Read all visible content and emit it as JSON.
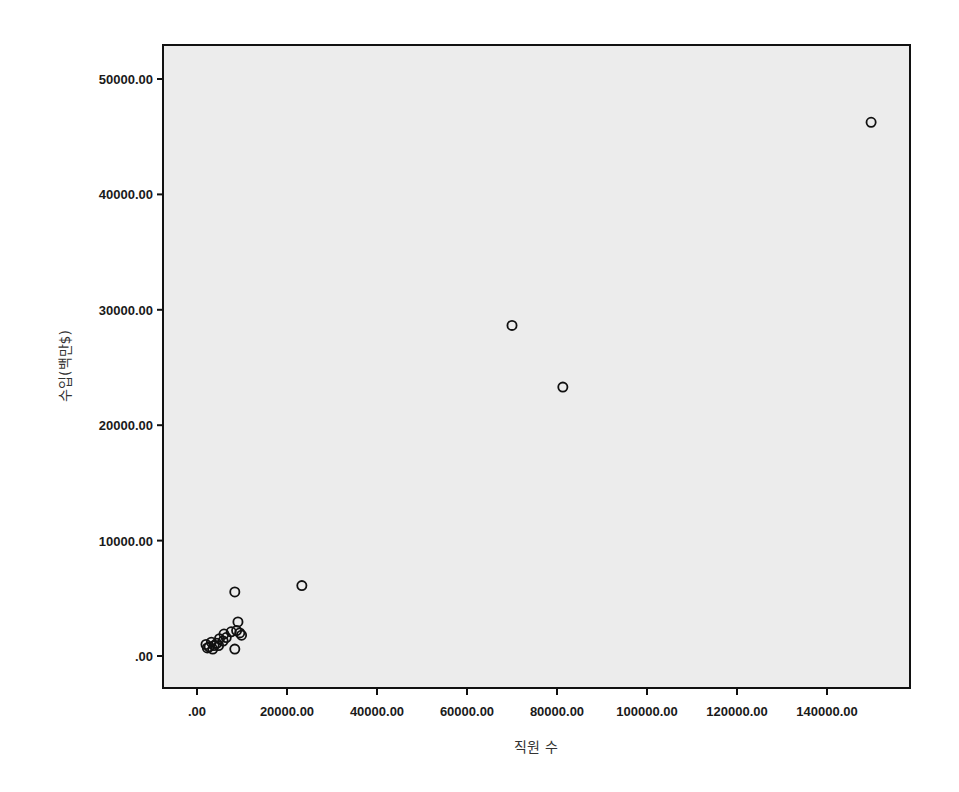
{
  "chart_data": {
    "type": "scatter",
    "title": "",
    "xlabel": "직원 수",
    "ylabel": "수입(백만$)",
    "xlim": [
      -8000,
      157000
    ],
    "ylim": [
      -2700,
      52500
    ],
    "x_ticks": [
      0,
      20000,
      40000,
      60000,
      80000,
      100000,
      120000,
      140000
    ],
    "x_tick_labels": [
      ".00",
      "20000.00",
      "40000.00",
      "60000.00",
      "80000.00",
      "100000.00",
      "120000.00",
      "140000.00"
    ],
    "y_ticks": [
      0,
      10000,
      20000,
      30000,
      40000,
      50000
    ],
    "y_tick_labels": [
      ".00",
      "10000.00",
      "20000.00",
      "30000.00",
      "40000.00",
      "50000.00"
    ],
    "grid": false,
    "legend": null,
    "marker": "hollow-circle",
    "colors": {
      "background": "#ececec",
      "marker": "#111111",
      "axis": "#111111"
    },
    "points": [
      {
        "x": 149800,
        "y": 46250
      },
      {
        "x": 70000,
        "y": 28650
      },
      {
        "x": 81300,
        "y": 23300
      },
      {
        "x": 23300,
        "y": 6100
      },
      {
        "x": 8400,
        "y": 5550
      },
      {
        "x": 9100,
        "y": 2950
      },
      {
        "x": 8400,
        "y": 600
      },
      {
        "x": 9500,
        "y": 2000
      },
      {
        "x": 9900,
        "y": 1800
      },
      {
        "x": 8800,
        "y": 2200
      },
      {
        "x": 7600,
        "y": 2100
      },
      {
        "x": 6500,
        "y": 1600
      },
      {
        "x": 5800,
        "y": 1300
      },
      {
        "x": 5000,
        "y": 1500
      },
      {
        "x": 4400,
        "y": 1100
      },
      {
        "x": 3800,
        "y": 900
      },
      {
        "x": 3200,
        "y": 1200
      },
      {
        "x": 2700,
        "y": 800
      },
      {
        "x": 2300,
        "y": 700
      },
      {
        "x": 2000,
        "y": 1000
      },
      {
        "x": 3500,
        "y": 600
      },
      {
        "x": 4800,
        "y": 900
      },
      {
        "x": 6000,
        "y": 1900
      }
    ]
  }
}
